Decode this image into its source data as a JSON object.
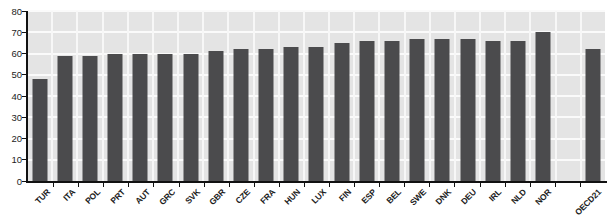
{
  "chart_data": {
    "type": "bar",
    "title": "",
    "xlabel": "",
    "ylabel": "",
    "categories": [
      "TUR",
      "ITA",
      "POL",
      "PRT",
      "AUT",
      "GRC",
      "SVK",
      "GBR",
      "CZE",
      "FRA",
      "HUN",
      "LUX",
      "FIN",
      "ESP",
      "BEL",
      "SWE",
      "DNK",
      "DEU",
      "IRL",
      "NLD",
      "NOR",
      "OECD21"
    ],
    "values": [
      48,
      59,
      59,
      60,
      60,
      60,
      60,
      61,
      62,
      62,
      63,
      63,
      65,
      66,
      66,
      67,
      67,
      67,
      66,
      66,
      70,
      62
    ],
    "ylim": [
      0,
      80
    ],
    "yticks": [
      0,
      10,
      20,
      30,
      40,
      50,
      60,
      70,
      80
    ],
    "grid": true,
    "legend": null,
    "separated_categories": [
      "OECD21"
    ],
    "bold_categories": [
      "OECD21"
    ],
    "colors": {
      "bar": "#4b4b4d",
      "plot_background": "#e4e4e4",
      "gridline": "#fafafa",
      "axis": "#111111",
      "label": "#1c1c1c"
    }
  }
}
